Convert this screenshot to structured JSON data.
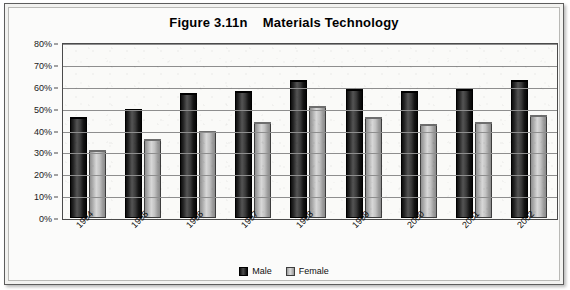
{
  "figure": {
    "title": "Figure 3.11n    Materials Technology"
  },
  "legend": {
    "male_label": "Male",
    "female_label": "Female",
    "male_color": "#1a1a1a",
    "female_color": "#c9c9c9"
  },
  "axis": {
    "y_ticks": [
      "0%",
      "10%",
      "20%",
      "30%",
      "40%",
      "50%",
      "60%",
      "70%",
      "80%"
    ]
  },
  "chart_data": {
    "type": "bar",
    "title": "Figure 3.11n    Materials Technology",
    "xlabel": "",
    "ylabel": "",
    "ylim": [
      0,
      80
    ],
    "ytick_step": 10,
    "ytick_format": "percent",
    "grid": true,
    "legend_position": "bottom-center",
    "categories": [
      "1994",
      "1995",
      "1996",
      "1997",
      "1998",
      "1999",
      "2000",
      "2001",
      "2002"
    ],
    "series": [
      {
        "name": "Male",
        "color": "#1a1a1a",
        "values": [
          46,
          50,
          57,
          58,
          63,
          59,
          58,
          59,
          63
        ]
      },
      {
        "name": "Female",
        "color": "#c9c9c9",
        "values": [
          31,
          36,
          40,
          44,
          51,
          46,
          43,
          44,
          47
        ]
      }
    ]
  }
}
